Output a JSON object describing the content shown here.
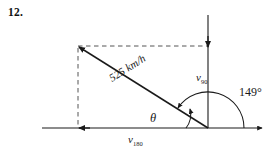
{
  "problem": {
    "number": "12."
  },
  "diagram": {
    "type": "vector-triangle",
    "resultant_label": "525 km/h",
    "vertical_component": {
      "symbol": "v",
      "subscript": "90"
    },
    "horizontal_component": {
      "symbol": "v",
      "subscript": "180"
    },
    "bearing_angle": "149°",
    "interior_angle": "θ",
    "colors": {
      "line": "#1a1a1a",
      "dashed": "#555555",
      "background": "#ffffff"
    }
  }
}
